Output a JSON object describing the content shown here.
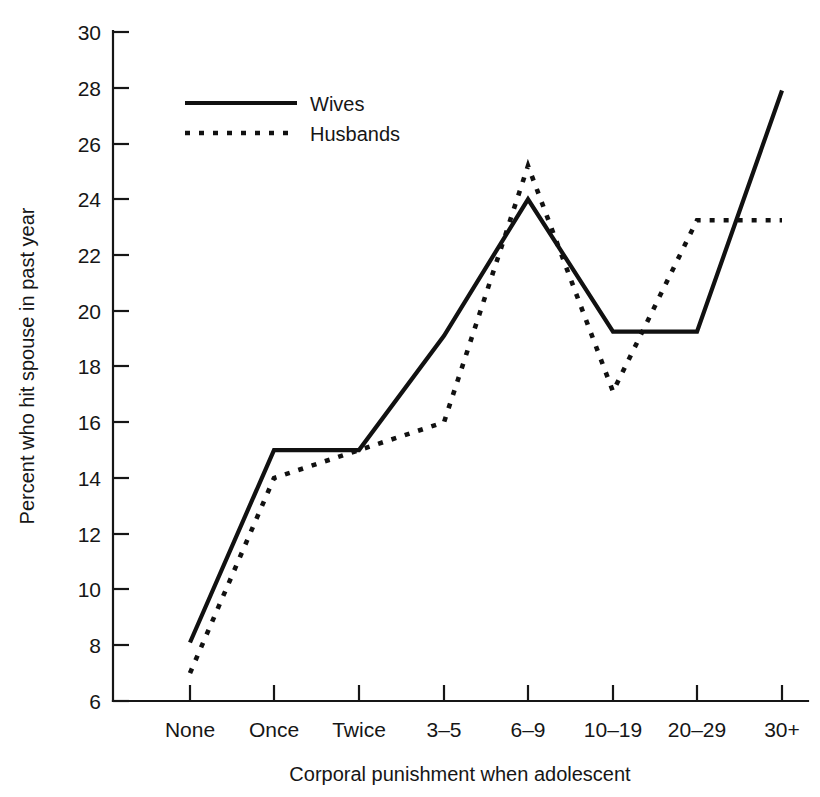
{
  "chart_data": {
    "type": "line",
    "title": "",
    "xlabel": "Corporal punishment when adolescent",
    "ylabel": "Percent who hit spouse in past year",
    "categories": [
      "None",
      "Once",
      "Twice",
      "3–5",
      "6–9",
      "10–19",
      "20–29",
      "30+"
    ],
    "series": [
      {
        "name": "Wives",
        "style": "solid",
        "values": [
          8.1,
          15.0,
          15.0,
          19.1,
          24.0,
          19.25,
          19.25,
          27.9
        ]
      },
      {
        "name": "Husbands",
        "style": "dotted",
        "values": [
          7.0,
          14.0,
          15.0,
          16.0,
          25.2,
          17.1,
          23.25,
          23.25
        ]
      }
    ],
    "ylim": [
      6,
      30
    ],
    "ytick_values": [
      6,
      8,
      10,
      12,
      14,
      16,
      18,
      20,
      22,
      24,
      26,
      28,
      30
    ],
    "ytick_labels": [
      "6",
      "8",
      "10",
      "12",
      "14",
      "16",
      "18",
      "20",
      "22",
      "24",
      "26",
      "28",
      "30"
    ],
    "grid": false,
    "legend_position": "top-left-inside"
  },
  "axes": {
    "x_title": "Corporal punishment when adolescent",
    "y_title": "Percent who hit spouse in past year"
  },
  "legend": {
    "entries": [
      {
        "label": "Wives"
      },
      {
        "label": "Husbands"
      }
    ]
  },
  "colors": {
    "ink": "#111111",
    "background": "#ffffff"
  }
}
